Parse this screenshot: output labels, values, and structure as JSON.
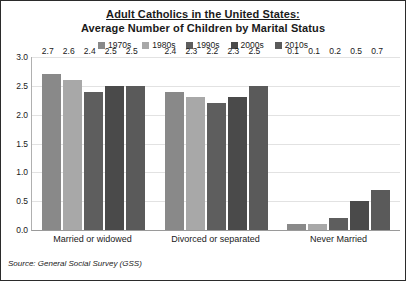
{
  "chart_data": {
    "type": "bar",
    "title": "Adult Catholics in the United States:",
    "subtitle": "Average Number of Children by Marital Status",
    "xlabel": "",
    "ylabel": "",
    "ylim": [
      0,
      3.0
    ],
    "ytick_labels": [
      "0.0",
      "0.5",
      "1.0",
      "1.5",
      "2.0",
      "2.5",
      "3.0"
    ],
    "ytick_values": [
      0,
      0.5,
      1.0,
      1.5,
      2.0,
      2.5,
      3.0
    ],
    "grid": true,
    "legend_position": "top",
    "categories": [
      "Married or widowed",
      "Divorced or separated",
      "Never Married"
    ],
    "series": [
      {
        "name": "1970s",
        "color": "#898989",
        "values": [
          2.7,
          2.4,
          0.1
        ],
        "labels": [
          "2.7",
          "2.4",
          "0.1"
        ]
      },
      {
        "name": "1980s",
        "color": "#a8a8a8",
        "values": [
          2.6,
          2.3,
          0.1
        ],
        "labels": [
          "2.6",
          "2.3",
          "0.1"
        ]
      },
      {
        "name": "1990s",
        "color": "#5e5e5e",
        "values": [
          2.4,
          2.2,
          0.2
        ],
        "labels": [
          "2.4",
          "2.2",
          "0.2"
        ]
      },
      {
        "name": "2000s",
        "color": "#4a4a4a",
        "values": [
          2.5,
          2.3,
          0.5
        ],
        "labels": [
          "2.5",
          "2.3",
          "0.5"
        ]
      },
      {
        "name": "2010s",
        "color": "#5a5a5a",
        "values": [
          2.5,
          2.5,
          0.7
        ],
        "labels": [
          "2.5",
          "2.5",
          "0.7"
        ]
      }
    ],
    "annotations": {
      "source": "Source: General Social Survey (GSS)"
    }
  }
}
